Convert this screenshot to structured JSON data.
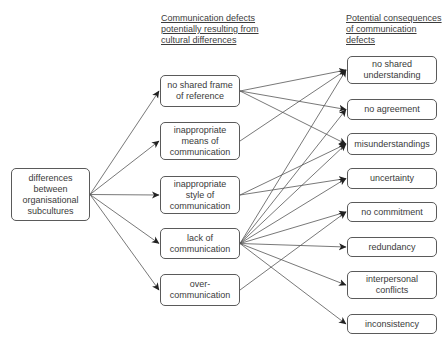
{
  "headers": {
    "middle": [
      "Communication defects",
      "potentially resulting from",
      "cultural differences"
    ],
    "right": [
      "Potential consequences",
      "of communication",
      "defects"
    ]
  },
  "source": {
    "id": "differences",
    "lines": [
      "differences",
      "between",
      "organisational",
      "subcultures"
    ],
    "box": [
      11,
      168,
      90,
      221
    ]
  },
  "defects": [
    {
      "id": "frame",
      "lines": [
        "no shared frame",
        "of reference"
      ],
      "box": [
        160,
        75,
        240,
        107
      ]
    },
    {
      "id": "means",
      "lines": [
        "inappropriate",
        "means of",
        "communication"
      ],
      "box": [
        160,
        122,
        240,
        160
      ]
    },
    {
      "id": "style",
      "lines": [
        "inappropriate",
        "style of",
        "communication"
      ],
      "box": [
        160,
        176,
        240,
        214
      ]
    },
    {
      "id": "lack",
      "lines": [
        "lack of",
        "communication"
      ],
      "box": [
        160,
        228,
        240,
        259
      ]
    },
    {
      "id": "over",
      "lines": [
        "over-",
        "communication"
      ],
      "box": [
        160,
        274,
        240,
        306
      ]
    }
  ],
  "consequences": [
    {
      "id": "understanding",
      "lines": [
        "no shared",
        "understanding"
      ],
      "box": [
        347,
        56,
        437,
        84
      ]
    },
    {
      "id": "agreement",
      "lines": [
        "no agreement"
      ],
      "box": [
        347,
        99,
        437,
        120
      ]
    },
    {
      "id": "misunderstandings",
      "lines": [
        "misunderstandings"
      ],
      "box": [
        347,
        133,
        437,
        155
      ]
    },
    {
      "id": "uncertainty",
      "lines": [
        "uncertainty"
      ],
      "box": [
        347,
        168,
        437,
        189
      ]
    },
    {
      "id": "commitment",
      "lines": [
        "no commitment"
      ],
      "box": [
        347,
        202,
        437,
        222
      ]
    },
    {
      "id": "redundancy",
      "lines": [
        "redundancy"
      ],
      "box": [
        347,
        237,
        437,
        257
      ]
    },
    {
      "id": "conflicts",
      "lines": [
        "interpersonal",
        "conflicts"
      ],
      "box": [
        347,
        271,
        437,
        299
      ]
    },
    {
      "id": "inconsistency",
      "lines": [
        "inconsistency"
      ],
      "box": [
        347,
        314,
        437,
        334
      ]
    }
  ],
  "edges": [
    [
      "differences",
      "frame"
    ],
    [
      "differences",
      "means"
    ],
    [
      "differences",
      "style"
    ],
    [
      "differences",
      "lack"
    ],
    [
      "differences",
      "over"
    ],
    [
      "frame",
      "understanding"
    ],
    [
      "frame",
      "agreement"
    ],
    [
      "frame",
      "misunderstandings"
    ],
    [
      "means",
      "understanding"
    ],
    [
      "style",
      "misunderstandings"
    ],
    [
      "style",
      "uncertainty"
    ],
    [
      "lack",
      "understanding"
    ],
    [
      "lack",
      "agreement"
    ],
    [
      "lack",
      "misunderstandings"
    ],
    [
      "lack",
      "uncertainty"
    ],
    [
      "lack",
      "commitment"
    ],
    [
      "lack",
      "redundancy"
    ],
    [
      "lack",
      "conflicts"
    ],
    [
      "lack",
      "inconsistency"
    ],
    [
      "over",
      "commitment"
    ]
  ],
  "colors": {
    "line": "#555555",
    "border": "#5a5a5a",
    "text": "#3a3a3a"
  }
}
